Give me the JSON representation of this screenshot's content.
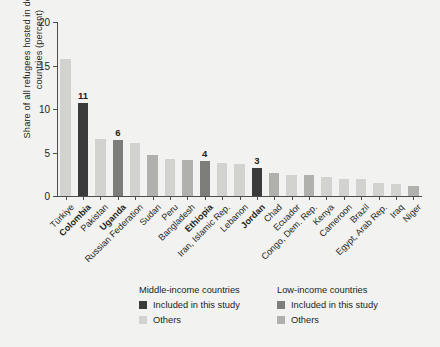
{
  "axes": {
    "ylabel": "Share of all refugees hosted in developing countries (percent)",
    "yticks": [
      "0",
      "5",
      "10",
      "15",
      "20"
    ]
  },
  "legend": {
    "columns": [
      {
        "title": "Middle-income countries",
        "items": [
          {
            "label": "Included in this study",
            "color": "#3b3b3b"
          },
          {
            "label": "Others",
            "color": "#d2d2cf"
          }
        ]
      },
      {
        "title": "Low-income countries",
        "items": [
          {
            "label": "Included in this study",
            "color": "#7d7d7a"
          },
          {
            "label": "Others",
            "color": "#b0b0ad"
          }
        ]
      }
    ]
  },
  "colors": {
    "background": "#f2f2f0",
    "axis": "#4d4d4d",
    "middle_included": "#3b3b3b",
    "middle_others": "#d2d2cf",
    "low_included": "#7d7d7a",
    "low_others": "#b0b0ad"
  },
  "chart_data": {
    "type": "bar",
    "title": "",
    "xlabel": "",
    "ylabel": "Share of all refugees hosted in developing countries (percent)",
    "ylim": [
      0,
      20
    ],
    "yticks": [
      0,
      5,
      10,
      15,
      20
    ],
    "grid": false,
    "legend_position": "bottom",
    "categories": [
      "Türkiye",
      "Colombia",
      "Pakistan",
      "Uganda",
      "Russian Federation",
      "Sudan",
      "Peru",
      "Bangladesh",
      "Ethiopia",
      "Iran, Islamic Rep.",
      "Lebanon",
      "Jordan",
      "Chad",
      "Ecuador",
      "Congo, Dem. Rep.",
      "Kenya",
      "Cameroon",
      "Brazil",
      "Egypt, Arab Rep.",
      "Iraq",
      "Niger"
    ],
    "values": [
      15.7,
      10.7,
      6.6,
      6.4,
      6.1,
      4.7,
      4.2,
      4.1,
      4.0,
      3.8,
      3.7,
      3.2,
      2.6,
      2.4,
      2.4,
      2.2,
      2.0,
      1.9,
      1.5,
      1.4,
      1.2
    ],
    "data_labels": [
      "",
      "11",
      "",
      "6",
      "",
      "",
      "",
      "",
      "4",
      "",
      "",
      "3",
      "",
      "",
      "",
      "",
      "",
      "",
      "",
      "",
      ""
    ],
    "group": [
      "middle_others",
      "middle_included",
      "middle_others",
      "low_included",
      "middle_others",
      "low_others",
      "middle_others",
      "low_others",
      "low_included",
      "middle_others",
      "middle_others",
      "middle_included",
      "low_others",
      "middle_others",
      "low_others",
      "middle_others",
      "middle_others",
      "middle_others",
      "middle_others",
      "middle_others",
      "low_others"
    ],
    "highlighted": [
      false,
      true,
      false,
      true,
      false,
      false,
      false,
      false,
      true,
      false,
      false,
      true,
      false,
      false,
      false,
      false,
      false,
      false,
      false,
      false,
      false
    ]
  }
}
